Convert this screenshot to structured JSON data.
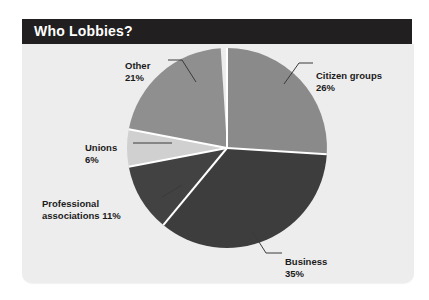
{
  "header": {
    "title": "Who Lobbies?"
  },
  "chart_data": {
    "type": "pie",
    "title": "Who Lobbies?",
    "xlabel": "",
    "ylabel": "",
    "legend_position": "none",
    "grid": false,
    "total_percent": 99,
    "categories": [
      "Citizen groups",
      "Business",
      "Professional associations",
      "Unions",
      "Other"
    ],
    "values": [
      26,
      35,
      11,
      6,
      21
    ],
    "slices": [
      {
        "name": "Citizen groups",
        "label": "Citizen groups",
        "percent": 26,
        "percent_label": "26%",
        "color": "#8a8a8a",
        "start_angle_deg": 0,
        "end_angle_deg": 93.6
      },
      {
        "name": "Business",
        "label": "Business",
        "percent": 35,
        "percent_label": "35%",
        "color": "#3d3d3d",
        "start_angle_deg": 93.6,
        "end_angle_deg": 219.6
      },
      {
        "name": "Professional associations",
        "label": "Professional\nassociations 11%",
        "percent": 11,
        "percent_label": "11%",
        "color": "#424242",
        "start_angle_deg": 219.6,
        "end_angle_deg": 259.2
      },
      {
        "name": "Unions",
        "label": "Unions",
        "percent": 6,
        "percent_label": "6%",
        "color": "#d0d0d0",
        "start_angle_deg": 259.2,
        "end_angle_deg": 280.8
      },
      {
        "name": "Other",
        "label": "Other",
        "percent": 21,
        "percent_label": "21%",
        "color": "#8f8f8f",
        "start_angle_deg": 280.8,
        "end_angle_deg": 356.4
      }
    ]
  },
  "labels": {
    "other": {
      "name": "Other",
      "percent": "21%"
    },
    "citizen_groups": {
      "name": "Citizen groups",
      "percent": "26%"
    },
    "unions": {
      "name": "Unions",
      "percent": "6%"
    },
    "professional_associations": {
      "line1": "Professional",
      "line2": "associations 11%"
    },
    "business": {
      "name": "Business",
      "percent": "35%"
    }
  },
  "colors": {
    "banner_background": "#221f20",
    "banner_text": "#ffffff",
    "panel_background": "#ededed",
    "slice_separator": "#ffffff",
    "label_text": "#1b1b1b",
    "leader_line": "#3a3a3a"
  }
}
